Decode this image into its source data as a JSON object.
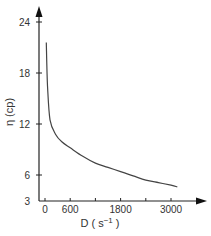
{
  "chart_data": {
    "type": "line",
    "title": "",
    "xlabel": "D (s⁻¹)",
    "ylabel": "η (cp)",
    "xlim": [
      0,
      3600
    ],
    "ylim": [
      3,
      25
    ],
    "x_ticks": [
      0,
      600,
      1200,
      1800,
      2400,
      3000
    ],
    "x_tick_labels": [
      "0",
      "600",
      "",
      "1800",
      "",
      "3000"
    ],
    "y_ticks": [
      3,
      6,
      12,
      18,
      24
    ],
    "y_tick_labels": [
      "3",
      "6",
      "12",
      "18",
      "24"
    ],
    "grid": false,
    "legend": null,
    "series": [
      {
        "name": "viscosity",
        "x": [
          30,
          60,
          120,
          250,
          400,
          600,
          900,
          1200,
          1500,
          1800,
          2100,
          2400,
          2700,
          3000,
          3150
        ],
        "values": [
          21.6,
          16.5,
          12.5,
          10.8,
          9.9,
          9.2,
          8.2,
          7.4,
          6.9,
          6.4,
          5.9,
          5.4,
          5.1,
          4.8,
          4.6
        ]
      }
    ]
  },
  "axes": {
    "x_label_prefix": "D",
    "x_label_unit": "s",
    "x_label_exp": "−1",
    "y_label": "η (cp)"
  }
}
